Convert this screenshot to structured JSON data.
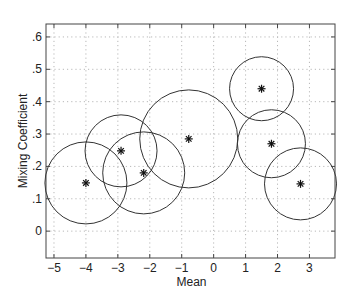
{
  "chart_data": {
    "type": "scatter",
    "title": "",
    "xlabel": "Mean",
    "ylabel": "Mixing Coefficient",
    "xlim": [
      -5.25,
      3.8
    ],
    "ylim": [
      -0.083,
      0.64
    ],
    "grid": true,
    "legend": null,
    "x_ticks": [
      -5,
      -4,
      -3,
      -2,
      -1,
      0,
      1,
      2,
      3
    ],
    "x_tick_labels": [
      "−5",
      "−4",
      "−3",
      "−2",
      "−1",
      "0",
      "1",
      "2",
      "3"
    ],
    "y_ticks": [
      0,
      0.1,
      0.2,
      0.3,
      0.4,
      0.5,
      0.6
    ],
    "y_tick_labels": [
      "0",
      ".1",
      ".2",
      ".3",
      ".4",
      ".5",
      ".6"
    ],
    "marker": "*",
    "series": [
      {
        "name": "components",
        "points": [
          {
            "x": -4.0,
            "y": 0.149,
            "radius_px": 41
          },
          {
            "x": -2.9,
            "y": 0.248,
            "radius_px": 36
          },
          {
            "x": -2.19,
            "y": 0.18,
            "radius_px": 41
          },
          {
            "x": -0.78,
            "y": 0.285,
            "radius_px": 49
          },
          {
            "x": 1.5,
            "y": 0.44,
            "radius_px": 32
          },
          {
            "x": 1.81,
            "y": 0.27,
            "radius_px": 34
          },
          {
            "x": 2.72,
            "y": 0.146,
            "radius_px": 36
          }
        ]
      }
    ]
  },
  "style": {
    "line_color": "#333333",
    "grid_color": "#b8b8b8",
    "axis_color": "#444444"
  }
}
